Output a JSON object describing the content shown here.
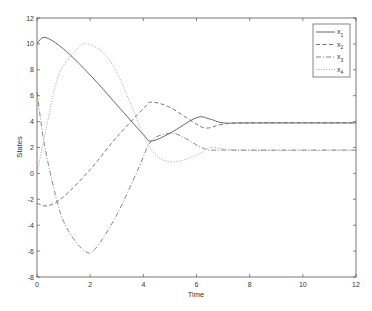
{
  "chart_data": {
    "type": "line",
    "title": "",
    "xlabel": "Time",
    "ylabel": "States",
    "xlim": [
      0,
      12
    ],
    "ylim": [
      -8,
      12
    ],
    "xticks": [
      0,
      2,
      4,
      6,
      8,
      10,
      12
    ],
    "yticks": [
      -8,
      -6,
      -4,
      -2,
      0,
      2,
      4,
      6,
      8,
      10,
      12
    ],
    "grid": false,
    "legend_position": "upper right",
    "series": [
      {
        "name": "x1",
        "style": "solid",
        "x": [
          0,
          0.3,
          1,
          2,
          3,
          4,
          4.3,
          5,
          6,
          6.5,
          7,
          8,
          12
        ],
        "y": [
          10,
          10.5,
          9.6,
          7.6,
          5.3,
          3.0,
          2.5,
          3.1,
          4.3,
          4.2,
          3.9,
          3.9,
          3.9
        ]
      },
      {
        "name": "x2",
        "style": "dashed",
        "x": [
          0,
          0.4,
          1,
          2,
          3,
          4,
          4.3,
          5,
          6,
          6.4,
          7,
          8,
          12
        ],
        "y": [
          -2.3,
          -2.5,
          -1.8,
          0.3,
          2.8,
          5.0,
          5.5,
          5.1,
          3.8,
          3.5,
          3.8,
          3.9,
          3.9
        ]
      },
      {
        "name": "x3",
        "style": "dashdot",
        "x": [
          0,
          0.3,
          0.8,
          1.2,
          1.8,
          2.2,
          3,
          3.8,
          4.3,
          5,
          5.5,
          6.3,
          7,
          12
        ],
        "y": [
          6.3,
          2,
          -2.5,
          -4.5,
          -6,
          -5.8,
          -3.2,
          0.3,
          2.5,
          3.1,
          2.8,
          1.9,
          1.8,
          1.8
        ]
      },
      {
        "name": "x4",
        "style": "dotted",
        "x": [
          0,
          0.3,
          0.8,
          1.5,
          1.9,
          2.5,
          3,
          3.6,
          4.1,
          4.6,
          5.2,
          6,
          6.5,
          7,
          8,
          12
        ],
        "y": [
          0,
          3,
          7.5,
          9.6,
          10,
          9.3,
          7.8,
          5,
          2.5,
          1.2,
          0.9,
          1.4,
          2,
          1.9,
          1.8,
          1.8
        ]
      }
    ]
  },
  "legend": {
    "items": [
      {
        "label": "x",
        "sub": "1"
      },
      {
        "label": "x",
        "sub": "2"
      },
      {
        "label": "x",
        "sub": "3"
      },
      {
        "label": "x",
        "sub": "4"
      }
    ]
  }
}
